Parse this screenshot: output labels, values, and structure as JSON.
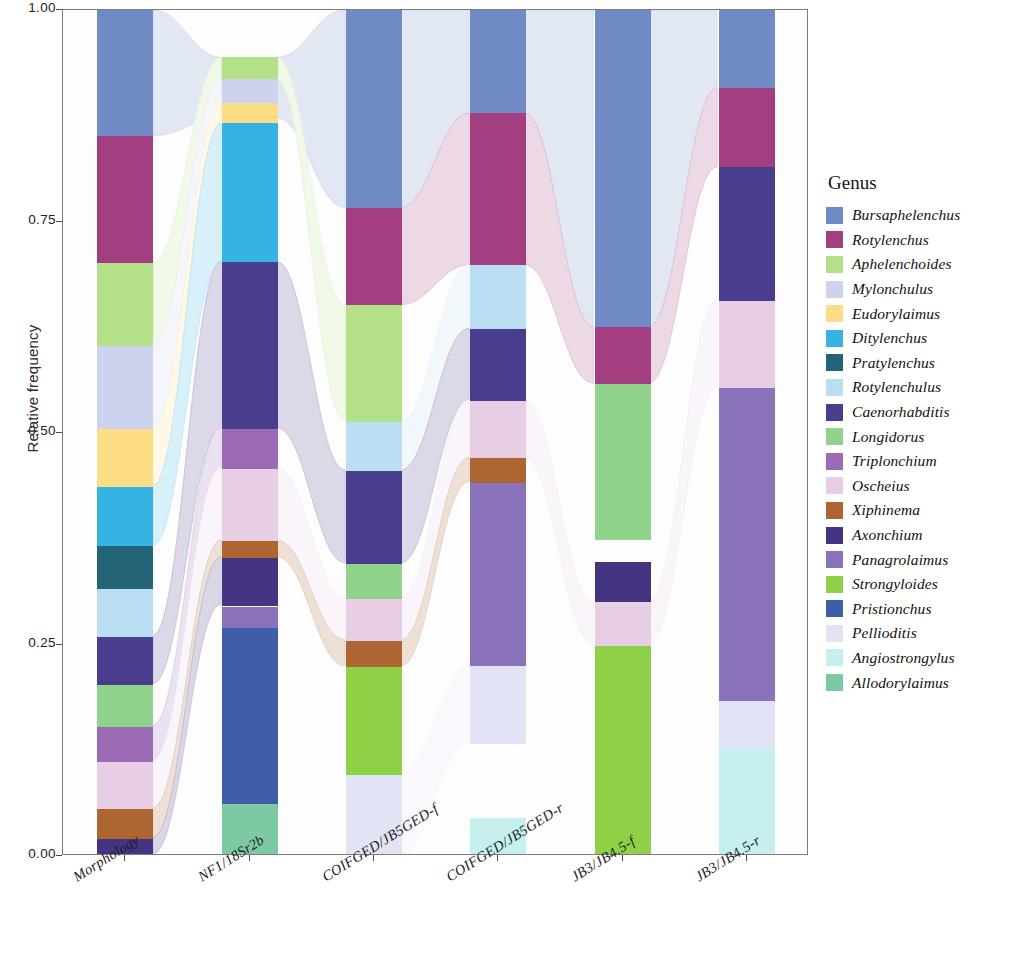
{
  "chart_data": {
    "type": "bar",
    "subtype": "stacked-alluvial",
    "title": "",
    "xlabel": "",
    "ylabel": "Relative frequency",
    "ylim": [
      0,
      1
    ],
    "ytick_labels": [
      "1.00",
      "0.75",
      "0.50",
      "0.25",
      "0.00"
    ],
    "ytick_values": [
      1.0,
      0.75,
      0.5,
      0.25,
      0.0
    ],
    "grid": false,
    "legend_position": "right",
    "legend_title": "Genus",
    "categories": [
      "Morphology",
      "NF1/18Sr2b",
      "COIFGED/JB5GED-f",
      "COIFGED/JB5GED-r",
      "JB3/JB4.5-f",
      "JB3/JB4.5-r"
    ],
    "series": [
      {
        "name": "Bursaphelenchus",
        "color": "#6f8ac4",
        "values": [
          0.149,
          0.072,
          0.232,
          0.122,
          0.34,
          0.092
        ]
      },
      {
        "name": "Rotylenchus",
        "color": "#a33f80",
        "values": [
          0.15,
          0.0,
          0.115,
          0.18,
          0.063,
          0.094
        ]
      },
      {
        "name": "Aphelenchoides",
        "color": "#b5e08a",
        "values": [
          0.098,
          0.026,
          0.137,
          0.0,
          0.0,
          0.0
        ]
      },
      {
        "name": "Mylonchulus",
        "color": "#cdd3ef",
        "values": [
          0.098,
          0.048,
          0.0,
          0.0,
          0.0,
          0.0
        ]
      },
      {
        "name": "Eudorylaimus",
        "color": "#fadd85",
        "values": [
          0.069,
          0.02,
          0.0,
          0.0,
          0.0,
          0.0
        ]
      },
      {
        "name": "Ditylenchus",
        "color": "#35b3e3",
        "values": [
          0.07,
          0.167,
          0.0,
          0.0,
          0.0,
          0.0
        ]
      },
      {
        "name": "Pratylenchus",
        "color": "#236477",
        "values": [
          0.05,
          0.0,
          0.0,
          0.0,
          0.0,
          0.0
        ]
      },
      {
        "name": "Rotylenchulus",
        "color": "#bbdef2",
        "values": [
          0.057,
          0.0,
          0.058,
          0.075,
          0.0,
          0.0
        ]
      },
      {
        "name": "Caenorhabditis",
        "color": "#493d8e",
        "values": [
          0.057,
          0.192,
          0.11,
          0.085,
          0.0,
          0.158
        ]
      },
      {
        "name": "Longidorus",
        "color": "#90d38d",
        "values": [
          0.049,
          0.0,
          0.041,
          0.0,
          0.18,
          0.0
        ]
      },
      {
        "name": "Triplonchium",
        "color": "#9b6bb5",
        "values": [
          0.042,
          0.04,
          0.0,
          0.0,
          0.0,
          0.0
        ]
      },
      {
        "name": "Oscheius",
        "color": "#e8cee4",
        "values": [
          0.018,
          0.086,
          0.05,
          0.068,
          0.031,
          0.103
        ]
      },
      {
        "name": "Xiphinema",
        "color": "#ad6632",
        "values": [
          0.018,
          0.017,
          0.031,
          0.029,
          0.0,
          0.0
        ]
      },
      {
        "name": "Axonchium",
        "color": "#453482",
        "values": [
          0.013,
          0.054,
          0.0,
          0.0,
          0.045,
          0.0
        ]
      },
      {
        "name": "Panagrolaimus",
        "color": "#8b73bb",
        "values": [
          0.0,
          0.023,
          0.0,
          0.217,
          0.0,
          0.37
        ]
      },
      {
        "name": "Strongyloides",
        "color": "#8ed046",
        "values": [
          0.0,
          0.0,
          0.13,
          0.0,
          0.246,
          0.0
        ]
      },
      {
        "name": "Pristionchus",
        "color": "#3e5fa8",
        "values": [
          0.0,
          0.2,
          0.0,
          0.0,
          0.049,
          0.0
        ]
      },
      {
        "name": "Pellioditis",
        "color": "#e2e3f4",
        "values": [
          0.062,
          0.0,
          0.096,
          0.092,
          0.046,
          0.055
        ]
      },
      {
        "name": "Angiostrongylus",
        "color": "#c6f0f0",
        "values": [
          0.0,
          0.0,
          0.0,
          0.045,
          0.0,
          0.128
        ]
      },
      {
        "name": "Allodorylaimus",
        "color": "#7dc9a4",
        "values": [
          0.0,
          0.055,
          0.0,
          0.0,
          0.0,
          0.0
        ]
      }
    ],
    "stacks": [
      {
        "category": "Morphology",
        "segments": [
          {
            "genus": "Bursaphelenchus",
            "color": "#6f8ac4",
            "start": 0.851,
            "end": 1.0
          },
          {
            "genus": "Rotylenchus",
            "color": "#a33f80",
            "start": 0.701,
            "end": 0.851
          },
          {
            "genus": "Aphelenchoides",
            "color": "#b5e08a",
            "start": 0.603,
            "end": 0.701
          },
          {
            "genus": "Mylonchulus",
            "color": "#cdd3ef",
            "start": 0.505,
            "end": 0.603
          },
          {
            "genus": "Eudorylaimus",
            "color": "#fadd85",
            "start": 0.436,
            "end": 0.505
          },
          {
            "genus": "Ditylenchus",
            "color": "#35b3e3",
            "start": 0.366,
            "end": 0.436
          },
          {
            "genus": "Pratylenchus",
            "color": "#236477",
            "start": 0.316,
            "end": 0.366
          },
          {
            "genus": "Rotylenchulus",
            "color": "#bbdef2",
            "start": 0.259,
            "end": 0.316
          },
          {
            "genus": "Caenorhabditis",
            "color": "#493d8e",
            "start": 0.202,
            "end": 0.259
          },
          {
            "genus": "Longidorus",
            "color": "#90d38d",
            "start": 0.153,
            "end": 0.202
          },
          {
            "genus": "Triplonchium",
            "color": "#9b6bb5",
            "start": 0.111,
            "end": 0.153
          },
          {
            "genus": "Oscheius",
            "color": "#e8cee4",
            "start": 0.055,
            "end": 0.111
          },
          {
            "genus": "Xiphinema",
            "color": "#ad6632",
            "start": 0.02,
            "end": 0.055
          },
          {
            "genus": "Axonchium",
            "color": "#453482",
            "start": 0.0,
            "end": 0.02
          }
        ]
      },
      {
        "category": "NF1/18Sr2b",
        "segments": [
          {
            "genus": "Bursaphelenchus",
            "color": "#6f8ac4",
            "start": 0.872,
            "end": 0.944
          },
          {
            "genus": "Aphelenchoides",
            "color": "#b5e08a",
            "start": 0.918,
            "end": 0.944
          },
          {
            "genus": "Mylonchulus",
            "color": "#cdd3ef",
            "start": 0.89,
            "end": 0.918
          },
          {
            "genus": "Eudorylaimus",
            "color": "#fadd85",
            "start": 0.866,
            "end": 0.89
          },
          {
            "genus": "Ditylenchus",
            "color": "#35b3e3",
            "start": 0.702,
            "end": 0.866
          },
          {
            "genus": "Caenorhabditis",
            "color": "#493d8e",
            "start": 0.505,
            "end": 0.702
          },
          {
            "genus": "Triplonchium",
            "color": "#9b6bb5",
            "start": 0.458,
            "end": 0.505
          },
          {
            "genus": "Oscheius",
            "color": "#e8cee4",
            "start": 0.372,
            "end": 0.458
          },
          {
            "genus": "Xiphinema",
            "color": "#ad6632",
            "start": 0.352,
            "end": 0.372
          },
          {
            "genus": "Axonchium",
            "color": "#453482",
            "start": 0.296,
            "end": 0.352
          },
          {
            "genus": "Panagrolaimus",
            "color": "#8b73bb",
            "start": 0.27,
            "end": 0.294
          },
          {
            "genus": "Pristionchus",
            "color": "#3e5fa8",
            "start": 0.061,
            "end": 0.27
          },
          {
            "genus": "Allodorylaimus",
            "color": "#7dc9a4",
            "start": 0.0,
            "end": 0.061
          }
        ]
      },
      {
        "category": "COIFGED/JB5GED-f",
        "segments": [
          {
            "genus": "Bursaphelenchus",
            "color": "#6f8ac4",
            "start": 0.766,
            "end": 1.0
          },
          {
            "genus": "Rotylenchus",
            "color": "#a33f80",
            "start": 0.651,
            "end": 0.766
          },
          {
            "genus": "Aphelenchoides",
            "color": "#b5e08a",
            "start": 0.513,
            "end": 0.651
          },
          {
            "genus": "Rotylenchulus",
            "color": "#bbdef2",
            "start": 0.455,
            "end": 0.513
          },
          {
            "genus": "Caenorhabditis",
            "color": "#493d8e",
            "start": 0.345,
            "end": 0.455
          },
          {
            "genus": "Longidorus",
            "color": "#90d38d",
            "start": 0.304,
            "end": 0.345
          },
          {
            "genus": "Oscheius",
            "color": "#e8cee4",
            "start": 0.254,
            "end": 0.304
          },
          {
            "genus": "Xiphinema",
            "color": "#ad6632",
            "start": 0.223,
            "end": 0.254
          },
          {
            "genus": "Strongyloides",
            "color": "#8ed046",
            "start": 0.096,
            "end": 0.223
          },
          {
            "genus": "Pellioditis",
            "color": "#e2e3f4",
            "start": 0.0,
            "end": 0.096
          }
        ]
      },
      {
        "category": "COIFGED/JB5GED-r",
        "segments": [
          {
            "genus": "Bursaphelenchus",
            "color": "#6f8ac4",
            "start": 0.878,
            "end": 1.0
          },
          {
            "genus": "Rotylenchus",
            "color": "#a33f80",
            "start": 0.698,
            "end": 0.878
          },
          {
            "genus": "Rotylenchulus",
            "color": "#bbdef2",
            "start": 0.623,
            "end": 0.698
          },
          {
            "genus": "Caenorhabditis",
            "color": "#493d8e",
            "start": 0.538,
            "end": 0.623
          },
          {
            "genus": "Oscheius",
            "color": "#e8cee4",
            "start": 0.47,
            "end": 0.538
          },
          {
            "genus": "Xiphinema",
            "color": "#ad6632",
            "start": 0.441,
            "end": 0.47
          },
          {
            "genus": "Panagrolaimus",
            "color": "#8b73bb",
            "start": 0.224,
            "end": 0.441
          },
          {
            "genus": "Pellioditis",
            "color": "#e2e3f4",
            "start": 0.132,
            "end": 0.224
          },
          {
            "genus": "Angiostrongylus",
            "color": "#c6f0f0",
            "start": 0.0,
            "end": 0.045
          }
        ]
      },
      {
        "category": "JB3/JB4.5-f",
        "segments": [
          {
            "genus": "Bursaphelenchus",
            "color": "#6f8ac4",
            "start": 0.625,
            "end": 1.0
          },
          {
            "genus": "Rotylenchus",
            "color": "#a33f80",
            "start": 0.558,
            "end": 0.625
          },
          {
            "genus": "Longidorus",
            "color": "#90d38d",
            "start": 0.374,
            "end": 0.558
          },
          {
            "genus": "Axonchium",
            "color": "#453482",
            "start": 0.3,
            "end": 0.348
          },
          {
            "genus": "Oscheius",
            "color": "#e8cee4",
            "start": 0.248,
            "end": 0.3
          },
          {
            "genus": "Strongyloides",
            "color": "#8ed046",
            "start": 0.002,
            "end": 0.248
          }
        ]
      },
      {
        "category": "JB3/JB4.5-r",
        "segments": [
          {
            "genus": "Bursaphelenchus",
            "color": "#6f8ac4",
            "start": 0.908,
            "end": 1.0
          },
          {
            "genus": "Rotylenchus",
            "color": "#a33f80",
            "start": 0.814,
            "end": 0.908
          },
          {
            "genus": "Caenorhabditis",
            "color": "#493d8e",
            "start": 0.656,
            "end": 0.814
          },
          {
            "genus": "Oscheius",
            "color": "#e8cee4",
            "start": 0.553,
            "end": 0.656
          },
          {
            "genus": "Panagrolaimus",
            "color": "#8b73bb",
            "start": 0.183,
            "end": 0.553
          },
          {
            "genus": "Pellioditis",
            "color": "#e2e3f4",
            "start": 0.128,
            "end": 0.183
          },
          {
            "genus": "Angiostrongylus",
            "color": "#c6f0f0",
            "start": 0.0,
            "end": 0.128
          }
        ]
      }
    ]
  }
}
